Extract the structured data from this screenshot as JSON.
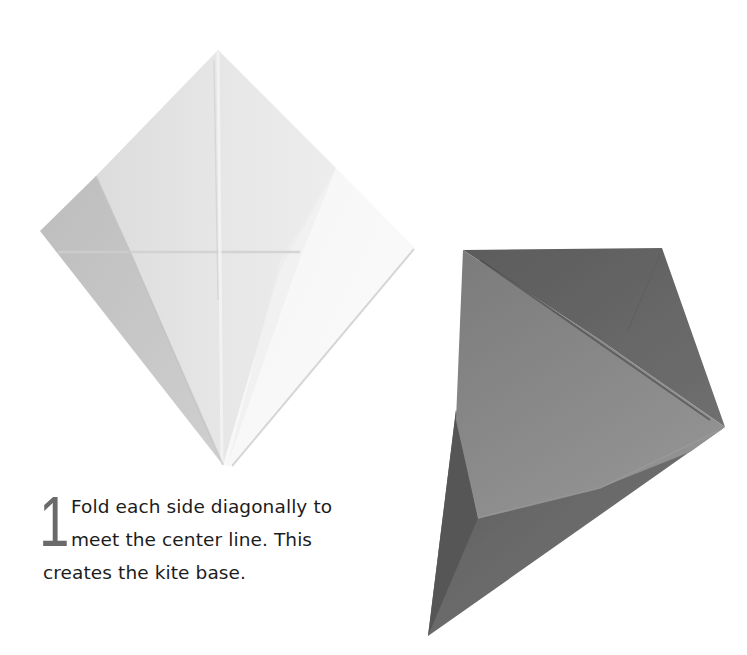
{
  "step": {
    "number": "1",
    "instruction": "Fold each side diagonally to meet the center line. This creates the kite base."
  },
  "figures": [
    {
      "name": "kite-base-front",
      "description": "white folded paper kite shape with creases"
    },
    {
      "name": "kite-base-side",
      "description": "grey folded paper shown at an angle"
    }
  ],
  "colors": {
    "background": "#ffffff",
    "text": "#1c1c1c",
    "step_number": "#6a6a6a",
    "paper_light": "#ececec",
    "paper_mid": "#d2d2d2",
    "paper_shade": "#b8b8b8",
    "paper_dark": "#6b6b6b",
    "paper_darker": "#555555",
    "paper_flap": "#8a8a8a"
  }
}
